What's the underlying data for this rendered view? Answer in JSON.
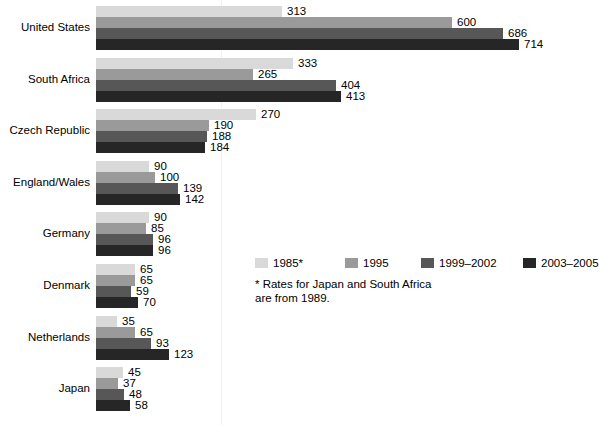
{
  "chart_data": {
    "type": "bar",
    "orientation": "horizontal",
    "title": "",
    "xlabel": "",
    "ylabel": "",
    "grid": true,
    "gridline_value": 210,
    "xlim": [
      0,
      714
    ],
    "legend_position": "center-right",
    "categories": [
      "United States",
      "South Africa",
      "Czech Republic",
      "England/Wales",
      "Germany",
      "Denmark",
      "Netherlands",
      "Japan"
    ],
    "series": [
      {
        "name": "1985*",
        "color": "#d9d9d9",
        "values": [
          313,
          333,
          270,
          90,
          90,
          65,
          35,
          45
        ]
      },
      {
        "name": "1995",
        "color": "#9a9a9a",
        "values": [
          600,
          265,
          190,
          100,
          85,
          65,
          65,
          37
        ]
      },
      {
        "name": "1999–2002",
        "color": "#575757",
        "values": [
          686,
          404,
          188,
          139,
          96,
          59,
          93,
          48
        ]
      },
      {
        "name": "2003–2005",
        "color": "#262626",
        "values": [
          714,
          413,
          184,
          142,
          96,
          70,
          123,
          58
        ]
      }
    ],
    "annotations": [
      "* Rates for Japan and South Africa\nare from 1989."
    ]
  },
  "legend": {
    "items": [
      {
        "label": "1985*",
        "color": "#d9d9d9"
      },
      {
        "label": "1995",
        "color": "#9a9a9a"
      },
      {
        "label": "1999–2002",
        "color": "#575757"
      },
      {
        "label": "2003–2005",
        "color": "#262626"
      }
    ]
  },
  "footnote": {
    "text": "* Rates for Japan and South Africa\nare from 1989."
  }
}
